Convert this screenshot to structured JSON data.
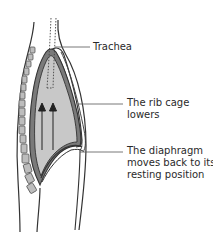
{
  "diagram": {
    "labels": {
      "trachea": {
        "lines": [
          "Trachea"
        ]
      },
      "rib_cage": {
        "lines": [
          "The rib cage",
          "lowers"
        ]
      },
      "diaphragm": {
        "lines": [
          "The diaphragm",
          "moves back to its",
          "resting position"
        ]
      }
    },
    "arrows": {
      "direction": "up",
      "count": 2
    },
    "colors": {
      "outline": "#333333",
      "lung_fill": "#c8c8c8",
      "lung_edge": "#7a7a7a",
      "vertebra_fill": "#bdbdbd",
      "leader_line": "#555555",
      "text": "#2a2a2a"
    }
  }
}
